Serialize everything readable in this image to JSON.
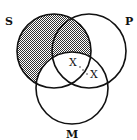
{
  "diagram": {
    "type": "venn-3",
    "circles": [
      {
        "label": "S",
        "cx": 54,
        "cy": 51,
        "r": 37
      },
      {
        "label": "P",
        "cx": 89,
        "cy": 51,
        "r": 37
      },
      {
        "label": "M",
        "cx": 72,
        "cy": 88,
        "r": 36
      }
    ],
    "labels": {
      "s": "S",
      "p": "P",
      "m": "M"
    },
    "marks": {
      "x1": "X",
      "x2": "X"
    },
    "shaded_region": "S minus M",
    "colors": {
      "stroke": "#111111",
      "shade": "#555555"
    }
  }
}
